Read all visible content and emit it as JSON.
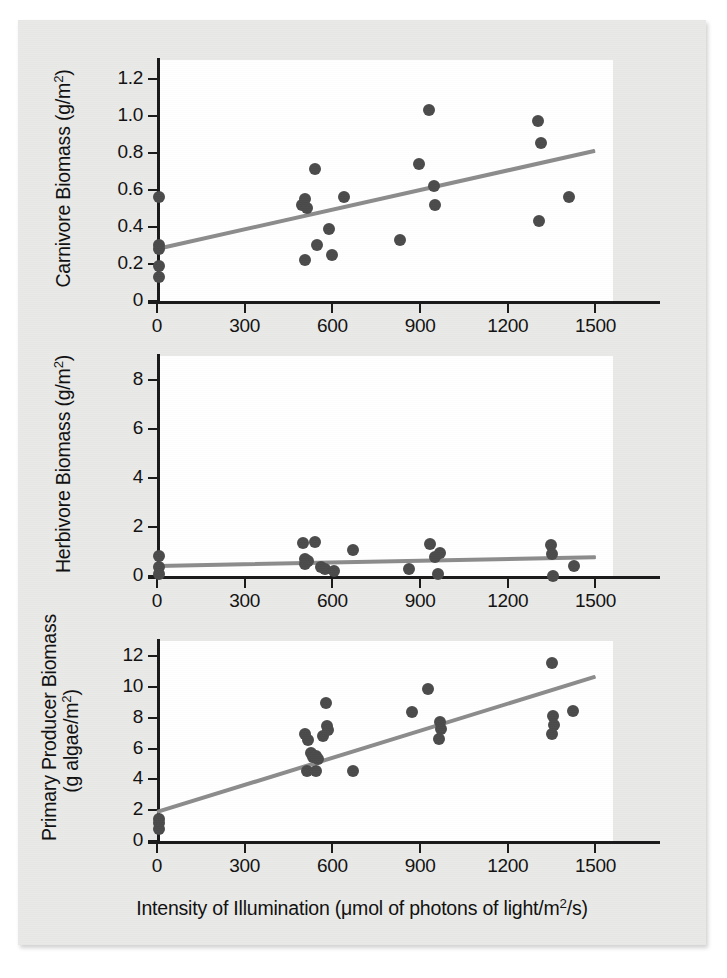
{
  "figure": {
    "xlabel": "Intensity of Illumination (μmol of photons of light/m²/s)",
    "marker_color": "#4b4b4b",
    "trend_color": "#8c8c8c",
    "axis_color": "#1a1a1a",
    "page_color": "#e9e9e7",
    "plot_background": "#ffffff"
  },
  "chart_data": [
    {
      "type": "scatter",
      "title": "",
      "ylabel": "Carnivore Biomass (g/m²)",
      "xlabel": "Intensity of Illumination (μmol of photons of light/m²/s)",
      "xlim": [
        0,
        1560
      ],
      "ylim": [
        0,
        1.3
      ],
      "xticks": [
        0,
        300,
        600,
        900,
        1200,
        1500
      ],
      "xticklabels": [
        "0",
        "300",
        "600",
        "900",
        "1200",
        "1500"
      ],
      "yticks": [
        0,
        0.2,
        0.4,
        0.6,
        0.8,
        1.0,
        1.2
      ],
      "yticklabels": [
        "0",
        "0.2",
        "0.4",
        "0.6",
        "0.8",
        "1.0",
        "1.2"
      ],
      "grid": false,
      "legend": "none",
      "points": [
        [
          8,
          0.56
        ],
        [
          8,
          0.3
        ],
        [
          8,
          0.28
        ],
        [
          8,
          0.19
        ],
        [
          8,
          0.13
        ],
        [
          495,
          0.52
        ],
        [
          505,
          0.55
        ],
        [
          512,
          0.5
        ],
        [
          505,
          0.22
        ],
        [
          540,
          0.71
        ],
        [
          548,
          0.3
        ],
        [
          590,
          0.39
        ],
        [
          598,
          0.25
        ],
        [
          640,
          0.56
        ],
        [
          832,
          0.33
        ],
        [
          898,
          0.74
        ],
        [
          930,
          1.03
        ],
        [
          948,
          0.62
        ],
        [
          952,
          0.52
        ],
        [
          1305,
          0.97
        ],
        [
          1312,
          0.85
        ],
        [
          1308,
          0.43
        ],
        [
          1408,
          0.56
        ]
      ],
      "trendline": {
        "x0": 0,
        "y0": 0.28,
        "x1": 1500,
        "y1": 0.81
      }
    },
    {
      "type": "scatter",
      "title": "",
      "ylabel": "Herbivore Biomass (g/m²)",
      "xlabel": "Intensity of Illumination (μmol of photons of light/m²/s)",
      "xlim": [
        0,
        1560
      ],
      "ylim": [
        0,
        9.0
      ],
      "xticks": [
        0,
        300,
        600,
        900,
        1200,
        1500
      ],
      "xticklabels": [
        "0",
        "300",
        "600",
        "900",
        "1200",
        "1500"
      ],
      "yticks": [
        0,
        2,
        4,
        6,
        8
      ],
      "yticklabels": [
        "0",
        "2",
        "4",
        "6",
        "8"
      ],
      "grid": false,
      "legend": "none",
      "points": [
        [
          8,
          0.8
        ],
        [
          8,
          0.35
        ],
        [
          8,
          0.1
        ],
        [
          500,
          1.35
        ],
        [
          540,
          1.4
        ],
        [
          505,
          0.7
        ],
        [
          515,
          0.62
        ],
        [
          508,
          0.48
        ],
        [
          562,
          0.38
        ],
        [
          575,
          0.3
        ],
        [
          605,
          0.2
        ],
        [
          672,
          1.05
        ],
        [
          862,
          0.28
        ],
        [
          935,
          1.3
        ],
        [
          952,
          0.78
        ],
        [
          968,
          0.95
        ],
        [
          962,
          0.08
        ],
        [
          1348,
          1.28
        ],
        [
          1352,
          0.88
        ],
        [
          1355,
          0.02
        ],
        [
          1428,
          0.42
        ]
      ],
      "trendline": {
        "x0": 0,
        "y0": 0.42,
        "x1": 1500,
        "y1": 0.78
      }
    },
    {
      "type": "scatter",
      "title": "",
      "ylabel": "Primary Producer Biomass (g algae/m²)",
      "ylabel_line1": "Primary Producer Biomass",
      "ylabel_line2": "(g algae/m²)",
      "xlabel": "Intensity of Illumination (μmol of photons of light/m²/s)",
      "xlim": [
        0,
        1560
      ],
      "ylim": [
        0,
        13.0
      ],
      "xticks": [
        0,
        300,
        600,
        900,
        1200,
        1500
      ],
      "xticklabels": [
        "0",
        "300",
        "600",
        "900",
        "1200",
        "1500"
      ],
      "yticks": [
        0,
        2,
        4,
        6,
        8,
        10,
        12
      ],
      "yticklabels": [
        "0",
        "2",
        "4",
        "6",
        "8",
        "10",
        "12"
      ],
      "grid": false,
      "legend": "none",
      "points": [
        [
          8,
          1.45
        ],
        [
          8,
          1.15
        ],
        [
          8,
          0.8
        ],
        [
          508,
          6.95
        ],
        [
          515,
          6.55
        ],
        [
          528,
          5.75
        ],
        [
          532,
          5.45
        ],
        [
          545,
          5.55
        ],
        [
          552,
          5.35
        ],
        [
          512,
          4.55
        ],
        [
          545,
          4.55
        ],
        [
          568,
          6.8
        ],
        [
          578,
          8.95
        ],
        [
          582,
          7.45
        ],
        [
          585,
          7.2
        ],
        [
          672,
          4.55
        ],
        [
          872,
          8.4
        ],
        [
          928,
          9.85
        ],
        [
          968,
          7.75
        ],
        [
          972,
          7.25
        ],
        [
          965,
          6.6
        ],
        [
          1352,
          11.55
        ],
        [
          1355,
          8.15
        ],
        [
          1358,
          7.55
        ],
        [
          1352,
          6.95
        ],
        [
          1422,
          8.45
        ]
      ],
      "trendline": {
        "x0": 0,
        "y0": 1.9,
        "x1": 1500,
        "y1": 10.7
      }
    }
  ]
}
